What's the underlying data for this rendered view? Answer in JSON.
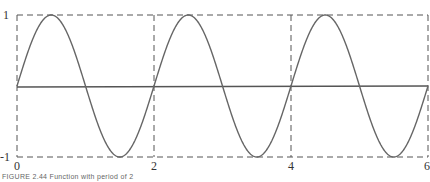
{
  "chart_data": {
    "type": "line",
    "title": "",
    "xlabel": "",
    "ylabel": "",
    "xlim": [
      0,
      6
    ],
    "ylim": [
      -1,
      1
    ],
    "x_ticks": [
      "0",
      "2",
      "4",
      "6"
    ],
    "y_ticks": [
      "1",
      "-1"
    ],
    "grid": "dashed bounding box with dashed verticals at x=2 and x=4",
    "series": [
      {
        "name": "sin(pi x)",
        "function": "y = sin(pi*x)",
        "period": 2,
        "x": [
          0,
          0.5,
          1,
          1.5,
          2,
          2.5,
          3,
          3.5,
          4,
          4.5,
          5,
          5.5,
          6
        ],
        "values": [
          0,
          1,
          0,
          -1,
          0,
          1,
          0,
          -1,
          0,
          1,
          0,
          -1,
          0
        ]
      },
      {
        "name": "axis",
        "x": [
          0,
          6
        ],
        "values": [
          0,
          0
        ]
      }
    ],
    "caption": "FIGURE 2.44 — Function with period of 2"
  },
  "labels": {
    "y_top": "1",
    "y_bottom": "-1",
    "x0": "0",
    "x2": "2",
    "x4": "4",
    "x6": "6",
    "caption": "FIGURE 2.44     Function with period of 2"
  }
}
